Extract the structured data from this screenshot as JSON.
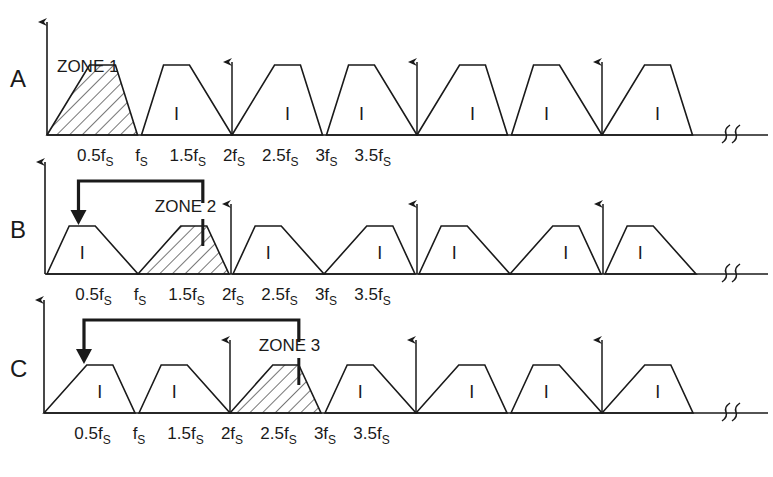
{
  "figure": {
    "tick_labels": [
      "0.5f",
      "f",
      "1.5f",
      "2f",
      "2.5f",
      "3f",
      "3.5f"
    ],
    "tick_subscript": "S",
    "band_label": "I",
    "colors": {
      "line": "#1a1a1a",
      "background": "#ffffff"
    }
  },
  "panels": [
    {
      "id": "A",
      "label": "A",
      "zone_label": "ZONE 1",
      "zone_index": 1,
      "images": [
        {
          "range": [
            0,
            0.5
          ],
          "hatched": true,
          "orientation": "normal"
        },
        {
          "range": [
            0.5,
            1.0
          ],
          "hatched": false,
          "orientation": "inverted"
        },
        {
          "range": [
            1.0,
            1.5
          ],
          "hatched": false,
          "orientation": "normal"
        },
        {
          "range": [
            1.5,
            2.0
          ],
          "hatched": false,
          "orientation": "inverted"
        },
        {
          "range": [
            2.0,
            2.5
          ],
          "hatched": false,
          "orientation": "normal"
        },
        {
          "range": [
            2.5,
            3.0
          ],
          "hatched": false,
          "orientation": "inverted"
        },
        {
          "range": [
            3.0,
            3.5
          ],
          "hatched": false,
          "orientation": "normal"
        }
      ]
    },
    {
      "id": "B",
      "label": "B",
      "zone_label": "ZONE 2",
      "zone_index": 2,
      "images": [
        {
          "range": [
            0,
            0.5
          ],
          "hatched": false,
          "orientation": "inverted"
        },
        {
          "range": [
            0.5,
            1.0
          ],
          "hatched": true,
          "orientation": "normal"
        },
        {
          "range": [
            1.0,
            1.5
          ],
          "hatched": false,
          "orientation": "inverted"
        },
        {
          "range": [
            1.5,
            2.0
          ],
          "hatched": false,
          "orientation": "normal"
        },
        {
          "range": [
            2.0,
            2.5
          ],
          "hatched": false,
          "orientation": "inverted"
        },
        {
          "range": [
            2.5,
            3.0
          ],
          "hatched": false,
          "orientation": "normal"
        },
        {
          "range": [
            3.0,
            3.5
          ],
          "hatched": false,
          "orientation": "inverted"
        }
      ]
    },
    {
      "id": "C",
      "label": "C",
      "zone_label": "ZONE 3",
      "zone_index": 3,
      "images": [
        {
          "range": [
            0,
            0.5
          ],
          "hatched": false,
          "orientation": "normal"
        },
        {
          "range": [
            0.5,
            1.0
          ],
          "hatched": false,
          "orientation": "inverted"
        },
        {
          "range": [
            1.0,
            1.5
          ],
          "hatched": true,
          "orientation": "normal"
        },
        {
          "range": [
            1.5,
            2.0
          ],
          "hatched": false,
          "orientation": "inverted"
        },
        {
          "range": [
            2.0,
            2.5
          ],
          "hatched": false,
          "orientation": "normal"
        },
        {
          "range": [
            2.5,
            3.0
          ],
          "hatched": false,
          "orientation": "inverted"
        },
        {
          "range": [
            3.0,
            3.5
          ],
          "hatched": false,
          "orientation": "normal"
        }
      ]
    }
  ]
}
